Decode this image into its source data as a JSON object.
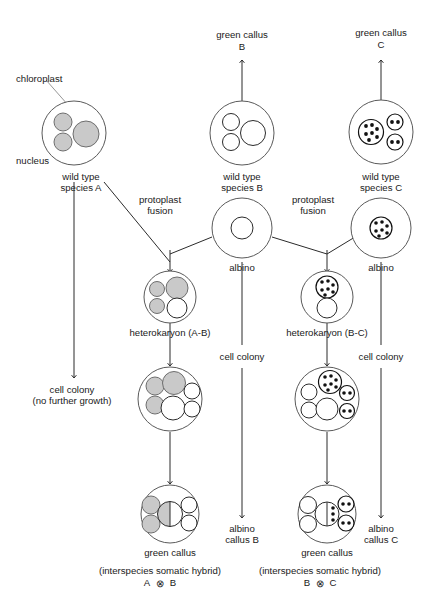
{
  "diagram": {
    "annotations": {
      "chloroplast": "chloroplast",
      "nucleus": "nucleus"
    },
    "colors": {
      "organelle_gray": "#c9c9c9",
      "organelle_white": "#ffffff",
      "outline": "#5a5a5a",
      "stroke": "#2b2b2b",
      "dot": "#111111",
      "leader": "#8a8a8a"
    },
    "columns": {
      "a": {
        "wild_type": "wild type\nspecies A",
        "wild_type_line1": "wild type",
        "wild_type_line2": "species A",
        "outcome_line1": "cell colony",
        "outcome_line2": "(no further growth)"
      },
      "b": {
        "green_callus_line1": "green callus",
        "green_callus_line2": "B",
        "wild_type_line1": "wild type",
        "wild_type_line2": "species B",
        "albino": "albino",
        "cell_colony": "cell colony",
        "albino_callus_line1": "albino",
        "albino_callus_line2": "callus B"
      },
      "c": {
        "green_callus_line1": "green callus",
        "green_callus_line2": "C",
        "wild_type_line1": "wild type",
        "wild_type_line2": "species C",
        "albino": "albino",
        "cell_colony": "cell colony",
        "albino_callus_line1": "albino",
        "albino_callus_line2": "callus C"
      }
    },
    "fusion_ab": {
      "fusion_label_line1": "protoplast",
      "fusion_label_line2": "fusion",
      "heterokaryon": "heterokaryon (A-B)",
      "green_callus": "green callus",
      "caption_line1": "(interspecies somatic hybrid)",
      "caption_line2_left": "A",
      "caption_line2_symbol": "⊗",
      "caption_line2_right": "B"
    },
    "fusion_bc": {
      "fusion_label_line1": "protoplast",
      "fusion_label_line2": "fusion",
      "heterokaryon": "heterokaryon (B-C)",
      "green_callus": "green callus",
      "caption_line1": "(interspecies somatic hybrid)",
      "caption_line2_left": "B",
      "caption_line2_symbol": "⊗",
      "caption_line2_right": "C"
    }
  }
}
